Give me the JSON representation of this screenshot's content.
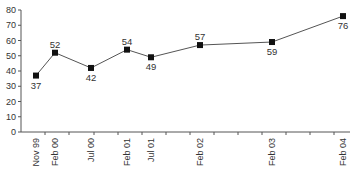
{
  "chart_data": {
    "type": "line",
    "title": "",
    "xlabel": "",
    "ylabel": "",
    "ylim": [
      0,
      80
    ],
    "yticks": [
      0,
      10,
      20,
      30,
      40,
      50,
      60,
      70,
      80
    ],
    "grid": false,
    "legend": null,
    "categories": [
      "Nov 99",
      "Feb 00",
      "Jul 00",
      "Feb 01",
      "Jul 01",
      "Feb 02",
      "Feb 03",
      "Feb 04"
    ],
    "series": [
      {
        "name": "series",
        "values": [
          37,
          52,
          42,
          54,
          49,
          57,
          59,
          76
        ]
      }
    ],
    "data_label_positions": [
      "below",
      "above",
      "below",
      "above",
      "below",
      "above",
      "below",
      "below"
    ]
  },
  "colors": {
    "line": "#555555",
    "marker": "#111111",
    "axis": "#555555",
    "text": "#333333"
  }
}
